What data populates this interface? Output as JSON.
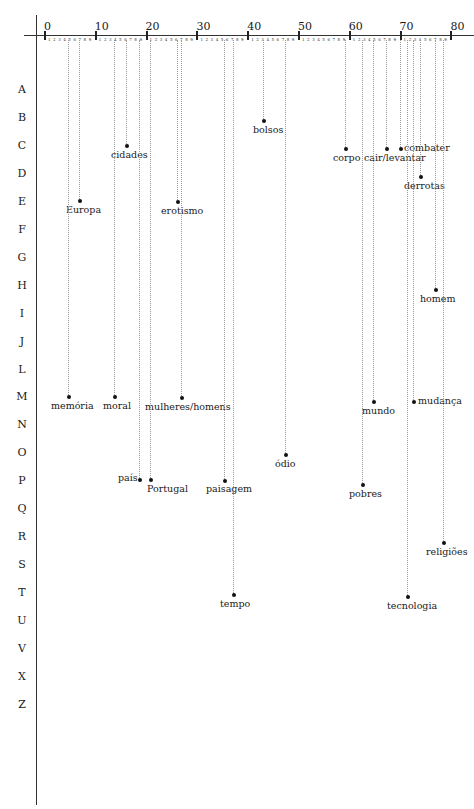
{
  "chart_data": {
    "type": "scatter",
    "title": "",
    "xlabel": "",
    "ylabel": "",
    "x_axis": {
      "range": [
        0,
        80
      ],
      "major_ticks": [
        0,
        10,
        20,
        30,
        40,
        50,
        60,
        70,
        80
      ],
      "minor_ticks_labels": [
        "1",
        "2",
        "3",
        "4",
        "5",
        "6",
        "7",
        "8",
        "9"
      ],
      "position": "top"
    },
    "y_axis": {
      "categories": [
        "A",
        "B",
        "C",
        "D",
        "E",
        "F",
        "G",
        "H",
        "I",
        "J",
        "L",
        "M",
        "N",
        "O",
        "P",
        "Q",
        "R",
        "S",
        "T",
        "U",
        "V",
        "X",
        "Z"
      ]
    },
    "grid": false,
    "points": [
      {
        "label": "bolsos",
        "x": 43,
        "row": "B"
      },
      {
        "label": "cidades",
        "x": 16,
        "row": "C"
      },
      {
        "label": "corpo",
        "x": 59,
        "row": "C"
      },
      {
        "label": "cair/levantar",
        "x": 67,
        "row": "C"
      },
      {
        "label": "combater",
        "x": 70,
        "row": "C"
      },
      {
        "label": "derrotas",
        "x": 74,
        "row": "D"
      },
      {
        "label": "Europa",
        "x": 7,
        "row": "E"
      },
      {
        "label": "erotismo",
        "x": 26,
        "row": "E"
      },
      {
        "label": "homem",
        "x": 77,
        "row": "H"
      },
      {
        "label": "memória",
        "x": 5,
        "row": "M"
      },
      {
        "label": "moral",
        "x": 13,
        "row": "M"
      },
      {
        "label": "mulheres/homens",
        "x": 27,
        "row": "M"
      },
      {
        "label": "mundo",
        "x": 65,
        "row": "M"
      },
      {
        "label": "mudança",
        "x": 72,
        "row": "M"
      },
      {
        "label": "ódio",
        "x": 47,
        "row": "O"
      },
      {
        "label": "país",
        "x": 18,
        "row": "P"
      },
      {
        "label": "Portugal",
        "x": 21,
        "row": "P"
      },
      {
        "label": "paisagem",
        "x": 35,
        "row": "P"
      },
      {
        "label": "pobres",
        "x": 63,
        "row": "P"
      },
      {
        "label": "religiões",
        "x": 79,
        "row": "R"
      },
      {
        "label": "tempo",
        "x": 37,
        "row": "T"
      },
      {
        "label": "tecnologia",
        "x": 71,
        "row": "T"
      }
    ]
  },
  "axis": {
    "major": [
      "0",
      "10",
      "20",
      "30",
      "40",
      "50",
      "60",
      "70",
      "80"
    ],
    "minor": "1 2 3 4 5 6 7 8 9",
    "rows": [
      "A",
      "B",
      "C",
      "D",
      "E",
      "F",
      "G",
      "H",
      "I",
      "J",
      "L",
      "M",
      "N",
      "O",
      "P",
      "Q",
      "R",
      "S",
      "T",
      "U",
      "V",
      "X",
      "Z"
    ]
  },
  "terms": [
    {
      "label": "bolsos",
      "px": 263,
      "py": 121,
      "lx": 253,
      "ly": 126
    },
    {
      "label": "cidades",
      "px": 126,
      "py": 146,
      "lx": 111,
      "ly": 151
    },
    {
      "label": "corpo",
      "px": 345,
      "py": 149,
      "lx": 333,
      "ly": 154
    },
    {
      "label": "cair/levantar",
      "px": 386,
      "py": 149,
      "lx": 364,
      "ly": 154
    },
    {
      "label": "combater",
      "px": 400,
      "py": 149,
      "lx": 404,
      "ly": 144
    },
    {
      "label": "derrotas",
      "px": 420,
      "py": 177,
      "lx": 404,
      "ly": 182
    },
    {
      "label": "Europa",
      "px": 79,
      "py": 201,
      "lx": 66,
      "ly": 206
    },
    {
      "label": "erotismo",
      "px": 177,
      "py": 202,
      "lx": 161,
      "ly": 207
    },
    {
      "label": "homem",
      "px": 435,
      "py": 290,
      "lx": 420,
      "ly": 295
    },
    {
      "label": "memória",
      "px": 68,
      "py": 397,
      "lx": 51,
      "ly": 402
    },
    {
      "label": "moral",
      "px": 114,
      "py": 397,
      "lx": 103,
      "ly": 402
    },
    {
      "label": "mulheres/homens",
      "px": 181,
      "py": 398,
      "lx": 145,
      "ly": 403
    },
    {
      "label": "mundo",
      "px": 373,
      "py": 402,
      "lx": 362,
      "ly": 407
    },
    {
      "label": "mudança",
      "px": 413,
      "py": 402,
      "lx": 418,
      "ly": 397
    },
    {
      "label": "ódio",
      "px": 285,
      "py": 455,
      "lx": 275,
      "ly": 460
    },
    {
      "label": "país",
      "px": 139,
      "py": 480,
      "lx": 118,
      "ly": 474
    },
    {
      "label": "Portugal",
      "px": 150,
      "py": 480,
      "lx": 147,
      "ly": 485
    },
    {
      "label": "paisagem",
      "px": 224,
      "py": 481,
      "lx": 206,
      "ly": 485
    },
    {
      "label": "pobres",
      "px": 362,
      "py": 485,
      "lx": 349,
      "ly": 490
    },
    {
      "label": "religiões",
      "px": 443,
      "py": 543,
      "lx": 426,
      "ly": 548
    },
    {
      "label": "tempo",
      "px": 233,
      "py": 595,
      "lx": 220,
      "ly": 600
    },
    {
      "label": "tecnologia",
      "px": 407,
      "py": 597,
      "lx": 387,
      "ly": 602
    }
  ]
}
